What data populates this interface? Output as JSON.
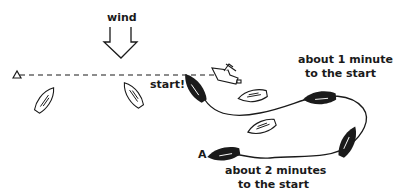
{
  "diagram": {
    "labels": {
      "wind": "wind",
      "start": "start!",
      "one_minute_line1": "about 1 minute",
      "one_minute_line2": "to the start",
      "two_minutes_line1": "about 2 minutes",
      "two_minutes_line2": "to the start",
      "boat_a": "A"
    },
    "elements": {
      "wind_arrow": "downward-hollow-arrow",
      "pin_end_mark": "triangle-buoy",
      "committee_boat": "committee-boat",
      "start_line": "dashed-line",
      "course_path": "solid-curve",
      "boats_white": 4,
      "boats_black": 4
    },
    "colors": {
      "ink": "#1a1a1a",
      "background": "#ffffff"
    }
  }
}
